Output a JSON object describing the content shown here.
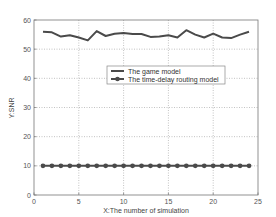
{
  "chart_data": {
    "type": "line",
    "title": "",
    "xlabel": "X:The number of simulation",
    "ylabel": "Y:SNR",
    "xlim": [
      0,
      25
    ],
    "ylim": [
      0,
      60
    ],
    "xticks": [
      0,
      5,
      10,
      15,
      20,
      25
    ],
    "yticks": [
      0,
      10,
      20,
      30,
      40,
      50,
      60
    ],
    "grid": true,
    "legend_position": "center-right",
    "x": [
      1,
      2,
      3,
      4,
      5,
      6,
      7,
      8,
      9,
      10,
      11,
      12,
      13,
      14,
      15,
      16,
      17,
      18,
      19,
      20,
      21,
      22,
      23,
      24
    ],
    "series": [
      {
        "name": "The game model",
        "marker": "none",
        "color": "#4a4a4a",
        "values": [
          56,
          55.8,
          54.3,
          54.8,
          54,
          53,
          56.2,
          54.5,
          55.3,
          55.5,
          55.2,
          55.2,
          54.2,
          54.3,
          54.8,
          54,
          56.5,
          55,
          54,
          55.3,
          54,
          53.8,
          55,
          56
        ]
      },
      {
        "name": "The time-delay routing model",
        "marker": "circle",
        "color": "#4a4a4a",
        "values": [
          10,
          10,
          10,
          10,
          10,
          10,
          10,
          10,
          10,
          10,
          10,
          10,
          10,
          10,
          10,
          10,
          10,
          10,
          10,
          10,
          10,
          10,
          10,
          10
        ]
      }
    ]
  }
}
